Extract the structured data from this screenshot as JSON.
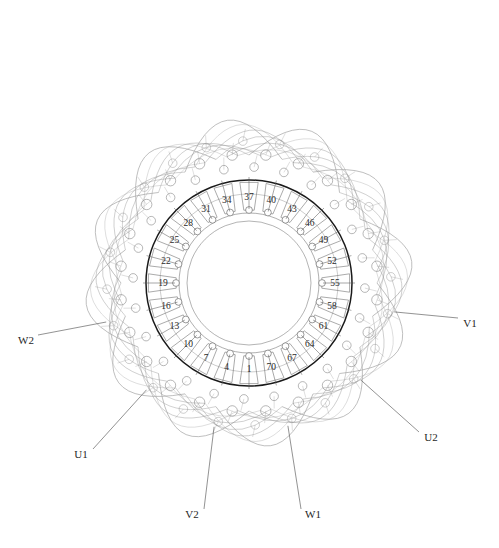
{
  "figure": {
    "type": "stator-winding-layout-diagram",
    "clipped_header_text": "",
    "machine": {
      "slot_count": 72,
      "phases": 3,
      "labelled_slot_step": 3
    },
    "colors": {
      "bore_circle": "#1a1a1a",
      "slot_outline": "#6f6f6f",
      "endwinding_arc": "#9a9a9a",
      "conductor_circle": "#8c8c8c",
      "leader_line": "#555555",
      "label_text": "#2b2b2b",
      "background": "#ffffff"
    },
    "geometry": {
      "center_x": 249,
      "center_y": 283,
      "r_bore": 103,
      "r_slot_bottom": 70,
      "r_inner_bore": 62,
      "r_stator_outer": 132,
      "r_endwinding_max": 212
    }
  },
  "slot_labels": [
    {
      "number": "1",
      "slot": 1
    },
    {
      "number": "4",
      "slot": 4
    },
    {
      "number": "7",
      "slot": 7
    },
    {
      "number": "10",
      "slot": 10
    },
    {
      "number": "13",
      "slot": 13
    },
    {
      "number": "16",
      "slot": 16
    },
    {
      "number": "19",
      "slot": 19
    },
    {
      "number": "22",
      "slot": 22
    },
    {
      "number": "25",
      "slot": 25
    },
    {
      "number": "28",
      "slot": 28
    },
    {
      "number": "31",
      "slot": 31
    },
    {
      "number": "34",
      "slot": 34
    },
    {
      "number": "37",
      "slot": 37
    },
    {
      "number": "40",
      "slot": 40
    },
    {
      "number": "43",
      "slot": 43
    },
    {
      "number": "46",
      "slot": 46
    },
    {
      "number": "49",
      "slot": 49
    },
    {
      "number": "52",
      "slot": 52
    },
    {
      "number": "55",
      "slot": 55
    },
    {
      "number": "58",
      "slot": 58
    },
    {
      "number": "61",
      "slot": 61
    },
    {
      "number": "64",
      "slot": 64
    },
    {
      "number": "67",
      "slot": 67
    },
    {
      "number": "70",
      "slot": 70
    }
  ],
  "terminals": [
    {
      "name": "U1",
      "label": "U1",
      "x": 81,
      "y": 458,
      "anchor": "middle"
    },
    {
      "name": "U2",
      "label": "U2",
      "x": 431,
      "y": 441,
      "anchor": "middle"
    },
    {
      "name": "V1",
      "label": "V1",
      "x": 470,
      "y": 327,
      "anchor": "middle"
    },
    {
      "name": "V2",
      "label": "V2",
      "x": 192,
      "y": 518,
      "anchor": "middle"
    },
    {
      "name": "W1",
      "label": "W1",
      "x": 313,
      "y": 518,
      "anchor": "middle"
    },
    {
      "name": "W2",
      "label": "W2",
      "x": 26,
      "y": 344,
      "anchor": "middle"
    }
  ]
}
